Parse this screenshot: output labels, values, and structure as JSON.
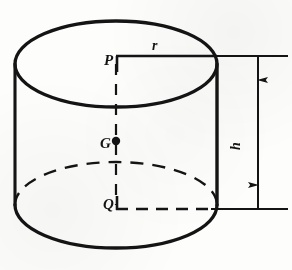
{
  "figure": {
    "type": "geometric-diagram",
    "background_color": "#fdfdfc",
    "ink_color": "#141414",
    "labels": {
      "top_center_point": "P",
      "radius": "r",
      "centroid_point": "G",
      "bottom_center_point": "Q",
      "height": "h"
    },
    "geometry": {
      "top_ellipse": {
        "cx": 116,
        "cy": 64,
        "rx": 101,
        "ry": 43
      },
      "bottom_ellipse": {
        "cx": 116,
        "cy": 205,
        "rx": 101,
        "ry": 43
      },
      "left_wall_x": 15,
      "right_wall_x": 217,
      "axis_x": 116,
      "axis_top_y": 64,
      "axis_bottom_y": 205,
      "centroid_y": 141,
      "dimension_line_x": 258,
      "extension_top_y": 64,
      "extension_bottom_y": 205,
      "extension_right_x": 288
    },
    "line_styles": {
      "visible_outline": "solid",
      "hidden_edge": "dashed",
      "axis": "dashed",
      "radius_leader": "solid",
      "dimension": "solid-with-arrowheads"
    }
  }
}
